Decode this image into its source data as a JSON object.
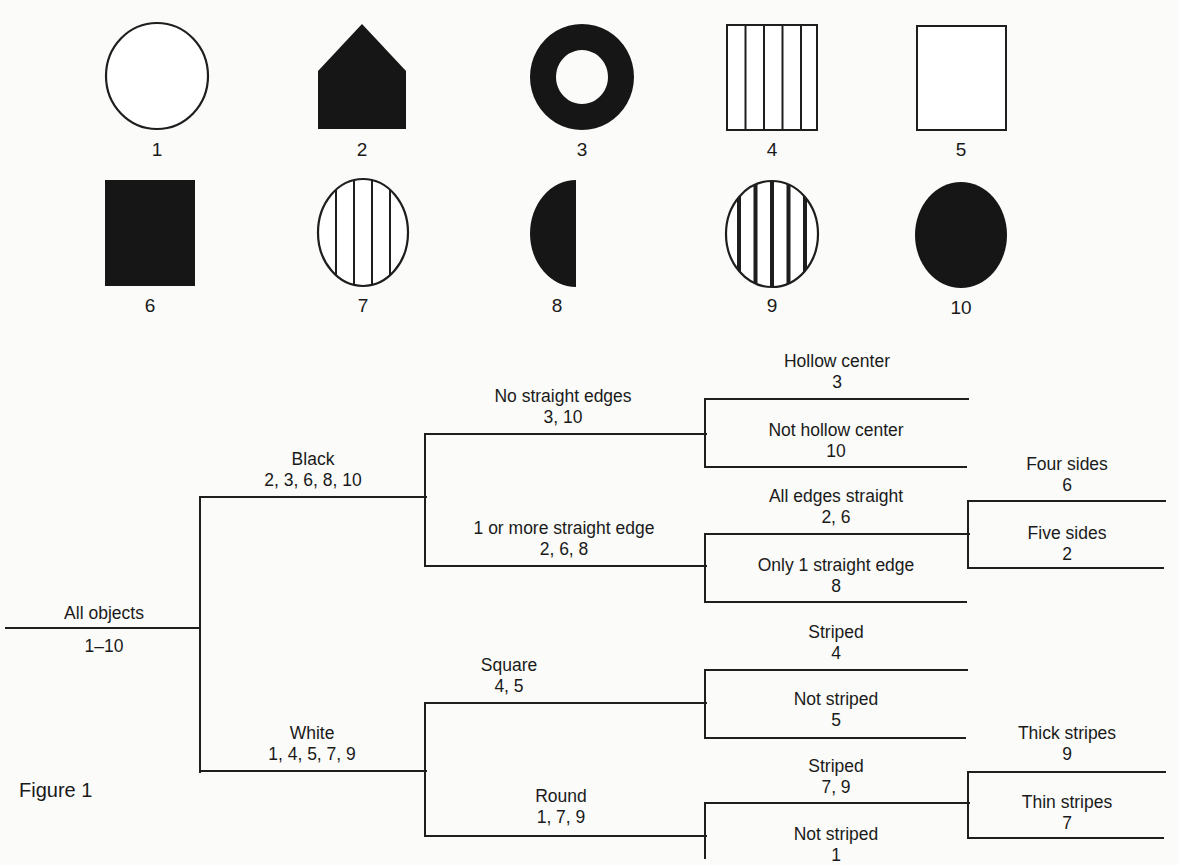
{
  "figure": {
    "caption": "Figure 1"
  },
  "shapes": [
    {
      "number": "1",
      "kind": "circle",
      "fill": "white",
      "stripes": "none",
      "x": 105,
      "y": 22,
      "w": 104,
      "h": 108
    },
    {
      "number": "2",
      "kind": "pentagon",
      "fill": "black",
      "stripes": "none",
      "x": 318,
      "y": 24,
      "w": 88,
      "h": 105
    },
    {
      "number": "3",
      "kind": "ring",
      "fill": "black",
      "stripes": "none",
      "x": 530,
      "y": 24,
      "w": 104,
      "h": 106
    },
    {
      "number": "4",
      "kind": "square",
      "fill": "white",
      "stripes": "thin",
      "x": 726,
      "y": 24,
      "w": 92,
      "h": 107
    },
    {
      "number": "5",
      "kind": "square",
      "fill": "white",
      "stripes": "none",
      "x": 916,
      "y": 25,
      "w": 91,
      "h": 106
    },
    {
      "number": "6",
      "kind": "square",
      "fill": "black",
      "stripes": "none",
      "x": 105,
      "y": 180,
      "w": 90,
      "h": 106
    },
    {
      "number": "7",
      "kind": "circle",
      "fill": "white",
      "stripes": "thin",
      "x": 317,
      "y": 178,
      "w": 92,
      "h": 109
    },
    {
      "number": "8",
      "kind": "half-circle",
      "fill": "black",
      "stripes": "none",
      "x": 530,
      "y": 180,
      "w": 46,
      "h": 107
    },
    {
      "number": "9",
      "kind": "circle",
      "fill": "white",
      "stripes": "thick",
      "x": 725,
      "y": 180,
      "w": 94,
      "h": 108
    },
    {
      "number": "10",
      "kind": "circle",
      "fill": "black",
      "stripes": "none",
      "x": 915,
      "y": 182,
      "w": 92,
      "h": 106
    }
  ],
  "tree": {
    "root": {
      "label": "All objects",
      "members": "1–10"
    },
    "black": {
      "label": "Black",
      "members": "2, 3, 6, 8, 10"
    },
    "white": {
      "label": "White",
      "members": "1, 4, 5, 7, 9"
    },
    "no_straight": {
      "label": "No straight edges",
      "members": "3, 10"
    },
    "one_or_more_straight": {
      "label": "1 or more straight edge",
      "members": "2, 6, 8"
    },
    "hollow": {
      "label": "Hollow center",
      "members": "3"
    },
    "not_hollow": {
      "label": "Not hollow center",
      "members": "10"
    },
    "all_straight": {
      "label": "All edges straight",
      "members": "2, 6"
    },
    "only_one_straight": {
      "label": "Only 1 straight edge",
      "members": "8"
    },
    "four_sides": {
      "label": "Four sides",
      "members": "6"
    },
    "five_sides": {
      "label": "Five sides",
      "members": "2"
    },
    "square": {
      "label": "Square",
      "members": "4, 5"
    },
    "round": {
      "label": "Round",
      "members": "1, 7, 9"
    },
    "square_striped": {
      "label": "Striped",
      "members": "4"
    },
    "square_not_striped": {
      "label": "Not striped",
      "members": "5"
    },
    "round_striped": {
      "label": "Striped",
      "members": "7, 9"
    },
    "round_not_striped": {
      "label": "Not striped",
      "members": "1"
    },
    "thick_stripes": {
      "label": "Thick stripes",
      "members": "9"
    },
    "thin_stripes": {
      "label": "Thin stripes",
      "members": "7"
    }
  },
  "colors": {
    "ink": "#1e1e1e",
    "paper": "#fbfbf9"
  }
}
